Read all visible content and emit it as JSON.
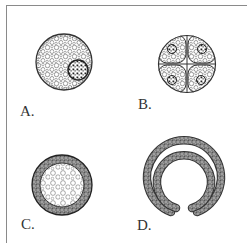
{
  "figure": {
    "panels": [
      {
        "id": "A",
        "label": "A.",
        "description": "Single cell with large yolk-filled cytoplasm and dark nucleus"
      },
      {
        "id": "B",
        "label": "B.",
        "description": "Four-cell stage, each cell with nucleus"
      },
      {
        "id": "C",
        "label": "C.",
        "description": "Blastula: ring of small cells surrounding yolk-filled cavity"
      },
      {
        "id": "D",
        "label": "D.",
        "description": "Gastrula: double-layered cup shape opening at bottom"
      }
    ],
    "colors": {
      "ink": "#333333",
      "frame": "#8a8a8a",
      "background": "#ffffff"
    }
  }
}
